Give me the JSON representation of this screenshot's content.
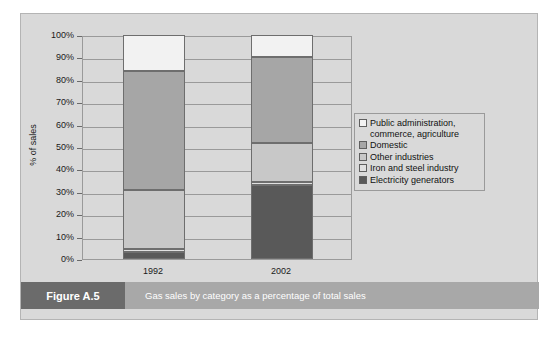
{
  "figure": {
    "tag": "Figure A.5",
    "caption": "Gas sales by category as a percentage of total sales"
  },
  "colors": {
    "panel_background": "#d9d9d9",
    "caption_bar": "#a8a8a8",
    "caption_tag": "#6b6b6b",
    "public_administration": "#f2f2f2",
    "domestic": "#a6a6a6",
    "other_industries": "#c8c8c8",
    "iron_and_steel": "#e0e0e0",
    "electricity_generators": "#595959",
    "gridline": "#9a9a9a",
    "bar_outline": "#6e6e6e"
  },
  "chart_data": {
    "type": "bar",
    "title": "",
    "xlabel": "",
    "ylabel": "% of sales",
    "ylim": [
      0,
      100
    ],
    "ytick_labels": [
      "0%",
      "10%",
      "20%",
      "30%",
      "40%",
      "50%",
      "60%",
      "70%",
      "80%",
      "90%",
      "100%"
    ],
    "ytick_values": [
      0,
      10,
      20,
      30,
      40,
      50,
      60,
      70,
      80,
      90,
      100
    ],
    "grid": true,
    "stacked": true,
    "legend_position": "right",
    "categories": [
      "1992",
      "2002"
    ],
    "series": [
      {
        "name": "Electricity generators",
        "key": "electricity_generators",
        "values": [
          3,
          33
        ]
      },
      {
        "name": "Iron and steel industry",
        "key": "iron_and_steel",
        "values": [
          1.5,
          1.5
        ]
      },
      {
        "name": "Other industries",
        "key": "other_industries",
        "values": [
          26.5,
          17.5
        ]
      },
      {
        "name": "Domestic",
        "key": "domestic",
        "values": [
          53,
          38
        ]
      },
      {
        "name": "Public administration, commerce, agriculture",
        "key": "public_administration",
        "values": [
          16,
          10
        ]
      }
    ]
  },
  "legend": {
    "items": [
      {
        "label": "Public administration,\ncommerce, agriculture",
        "key": "public_administration"
      },
      {
        "label": "Domestic",
        "key": "domestic"
      },
      {
        "label": "Other industries",
        "key": "other_industries"
      },
      {
        "label": "Iron and steel industry",
        "key": "iron_and_steel"
      },
      {
        "label": "Electricity generators",
        "key": "electricity_generators"
      }
    ]
  }
}
